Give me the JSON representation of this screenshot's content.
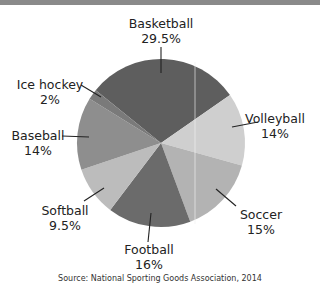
{
  "chart_data": {
    "type": "pie",
    "title": "",
    "start_angle_deg": -51,
    "direction": "clockwise",
    "slices": [
      {
        "label": "Basketball",
        "value": 29.5,
        "display": "29.5%",
        "color": "#5e5e5e"
      },
      {
        "label": "Volleyball",
        "value": 14,
        "display": "14%",
        "color": "#cfcfcf"
      },
      {
        "label": "Soccer",
        "value": 15,
        "display": "15%",
        "color": "#b3b3b3"
      },
      {
        "label": "Football",
        "value": 16,
        "display": "16%",
        "color": "#6b6b6b"
      },
      {
        "label": "Softball",
        "value": 9.5,
        "display": "9.5%",
        "color": "#bcbcbc"
      },
      {
        "label": "Baseball",
        "value": 14,
        "display": "14%",
        "color": "#8e8e8e"
      },
      {
        "label": "Ice hockey",
        "value": 2,
        "display": "2%",
        "color": "#7a7a7a"
      }
    ],
    "source": "Source: National Sporting Goods Association, 2014"
  },
  "labels": {
    "basketball": {
      "name": "Basketball",
      "pct": "29.5%"
    },
    "volleyball": {
      "name": "Volleyball",
      "pct": "14%"
    },
    "soccer": {
      "name": "Soccer",
      "pct": "15%"
    },
    "football": {
      "name": "Football",
      "pct": "16%"
    },
    "softball": {
      "name": "Softball",
      "pct": "9.5%"
    },
    "baseball": {
      "name": "Baseball",
      "pct": "14%"
    },
    "icehockey": {
      "name": "Ice hockey",
      "pct": "2%"
    }
  },
  "source": "Source: National Sporting Goods Association, 2014"
}
